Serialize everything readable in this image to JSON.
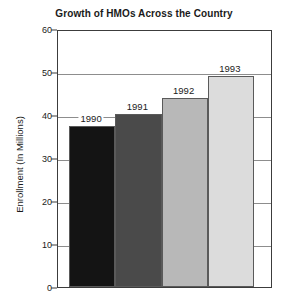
{
  "chart_data": {
    "type": "bar",
    "title": "Growth of HMOs Across the Country",
    "xlabel": "",
    "ylabel": "Enrollment (In Millions)",
    "categories": [
      "1990",
      "1991",
      "1992",
      "1993"
    ],
    "values": [
      37.5,
      40.2,
      44.0,
      49.0
    ],
    "series": [
      {
        "name": "Enrollment",
        "values": [
          37.5,
          40.2,
          44.0,
          49.0
        ]
      }
    ],
    "bar_labels": [
      "1990",
      "1991",
      "1992",
      "1993"
    ],
    "bar_colors": [
      "#141414",
      "#4a4a4a",
      "#b8b8b8",
      "#dcdcdc"
    ],
    "ylim": [
      0,
      60
    ],
    "yticks": [
      0,
      10,
      20,
      30,
      40,
      50,
      60
    ],
    "ytick_labels": [
      "0",
      "10",
      "20",
      "30",
      "40",
      "50",
      "60"
    ],
    "grid": true,
    "grid_axis": "y",
    "legend": "none",
    "legend_position": "none",
    "frame_color": "#3c3c3c",
    "gridline_color": "#8d8d8d",
    "background": "#ffffff",
    "text_color": "#1a1a1a"
  }
}
